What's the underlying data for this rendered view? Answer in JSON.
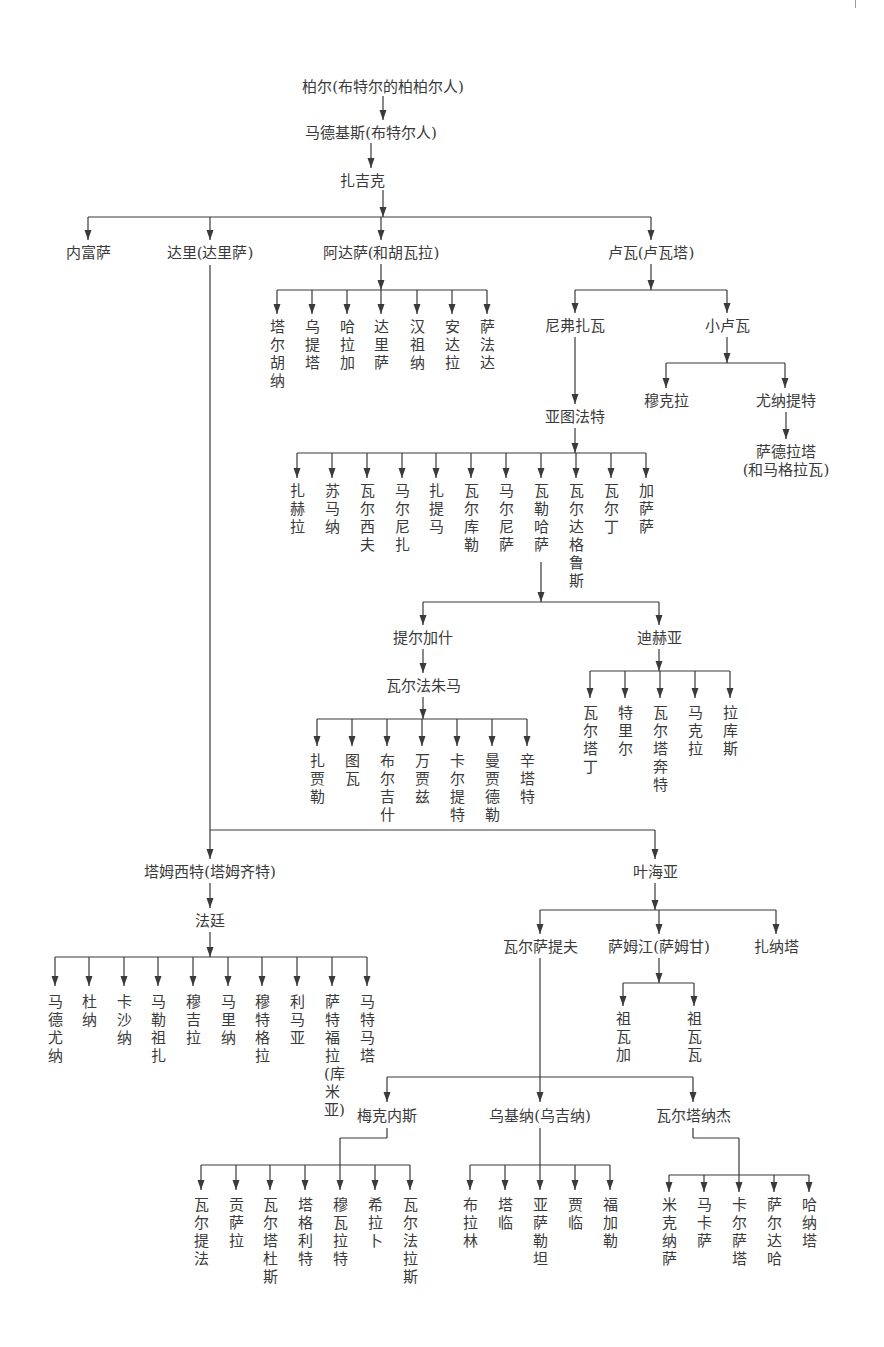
{
  "page": {
    "number_fragment": ""
  },
  "style": {
    "line_color": "#3a3a3a",
    "text_color": "#3a3a3a"
  },
  "nodes": {
    "bol": {
      "label": "柏尔(布特尔的柏柏尔人)",
      "x": 383,
      "y": 78
    },
    "madghis": {
      "label": "马德基斯(布特尔人)",
      "x": 371,
      "y": 124
    },
    "zajik": {
      "label": "扎吉克",
      "x": 362,
      "y": 172
    },
    "nefusa": {
      "label": "内富萨",
      "x": 88,
      "y": 244
    },
    "dari": {
      "label": "达里(达里萨)",
      "x": 210,
      "y": 244
    },
    "adasa": {
      "label": "阿达萨(和胡瓦拉)",
      "x": 381,
      "y": 244
    },
    "luwa": {
      "label": "卢瓦(卢瓦塔)",
      "x": 651,
      "y": 244
    },
    "nifzawa": {
      "label": "尼弗扎瓦",
      "x": 575,
      "y": 317
    },
    "little_luwa": {
      "label": "小卢瓦",
      "x": 727,
      "y": 317
    },
    "mukla": {
      "label": "穆克拉",
      "x": 666,
      "y": 392
    },
    "yunatit": {
      "label": "尤纳提特",
      "x": 786,
      "y": 392
    },
    "sadrata_1": {
      "label": "萨德拉塔",
      "x": 786,
      "y": 443
    },
    "sadrata_2": {
      "label": "(和马格拉瓦)",
      "x": 786,
      "y": 461
    },
    "yatufat": {
      "label": "亚图法特",
      "x": 575,
      "y": 408
    },
    "tirgash": {
      "label": "提尔加什",
      "x": 423,
      "y": 629
    },
    "dihya": {
      "label": "迪赫亚",
      "x": 659,
      "y": 629
    },
    "warfajuma": {
      "label": "瓦尔法朱马",
      "x": 423,
      "y": 677
    },
    "tamsit": {
      "label": "塔姆西特(塔姆齐特)",
      "x": 210,
      "y": 863
    },
    "yahya": {
      "label": "叶海亚",
      "x": 655,
      "y": 863
    },
    "fatin": {
      "label": "法廷",
      "x": 210,
      "y": 912
    },
    "warsatif": {
      "label": "瓦尔萨提夫",
      "x": 540,
      "y": 938
    },
    "samjan": {
      "label": "萨姆江(萨姆甘)",
      "x": 659,
      "y": 938
    },
    "zanata": {
      "label": "扎纳塔",
      "x": 776,
      "y": 938
    },
    "meknes": {
      "label": "梅克内斯",
      "x": 387,
      "y": 1107
    },
    "ukina": {
      "label": "乌基纳(乌吉纳)",
      "x": 540,
      "y": 1107
    },
    "wartanaj": {
      "label": "瓦尔塔纳杰",
      "x": 693,
      "y": 1107
    }
  },
  "vertical_groups": {
    "adasa_children": {
      "y": 318,
      "items": [
        {
          "label": "塔尔胡纳",
          "x": 277
        },
        {
          "label": "乌提塔",
          "x": 312
        },
        {
          "label": "哈拉加",
          "x": 347
        },
        {
          "label": "达里萨",
          "x": 381
        },
        {
          "label": "汉祖纳",
          "x": 417
        },
        {
          "label": "安达拉",
          "x": 452
        },
        {
          "label": "萨法达",
          "x": 487
        }
      ]
    },
    "yatufat_children": {
      "y": 482,
      "items": [
        {
          "label": "扎赫拉",
          "x": 297
        },
        {
          "label": "苏马纳",
          "x": 332
        },
        {
          "label": "瓦尔西夫",
          "x": 367
        },
        {
          "label": "马尔尼扎",
          "x": 402
        },
        {
          "label": "扎提马",
          "x": 436
        },
        {
          "label": "瓦尔库勒",
          "x": 471
        },
        {
          "label": "马尔尼萨",
          "x": 506
        },
        {
          "label": "瓦勒哈萨",
          "x": 541
        },
        {
          "label": "瓦尔达格鲁斯",
          "x": 576
        },
        {
          "label": "瓦尔丁",
          "x": 611
        },
        {
          "label": "加萨萨",
          "x": 646
        }
      ]
    },
    "warfajuma_children": {
      "y": 752,
      "items": [
        {
          "label": "扎贾勒",
          "x": 317
        },
        {
          "label": "图瓦",
          "x": 352
        },
        {
          "label": "布尔吉什",
          "x": 387
        },
        {
          "label": "万贾兹",
          "x": 422
        },
        {
          "label": "卡尔提特",
          "x": 457
        },
        {
          "label": "曼贾德勒",
          "x": 492
        },
        {
          "label": "辛塔特",
          "x": 527
        }
      ]
    },
    "dihya_children": {
      "y": 704,
      "items": [
        {
          "label": "瓦尔塔丁",
          "x": 590
        },
        {
          "label": "特里尔",
          "x": 625
        },
        {
          "label": "瓦尔塔奔特",
          "x": 660
        },
        {
          "label": "马克拉",
          "x": 695
        },
        {
          "label": "拉库斯",
          "x": 730
        }
      ]
    },
    "fatin_children": {
      "y": 993,
      "items": [
        {
          "label": "马德尤纳",
          "x": 55
        },
        {
          "label": "杜纳",
          "x": 89
        },
        {
          "label": "卡沙纳",
          "x": 124
        },
        {
          "label": "马勒祖扎",
          "x": 158
        },
        {
          "label": "穆吉拉",
          "x": 193
        },
        {
          "label": "马里纳",
          "x": 228
        },
        {
          "label": "穆特格拉",
          "x": 262
        },
        {
          "label": "利马亚",
          "x": 297
        },
        {
          "label": "萨特福拉(库米亚)",
          "x": 332
        },
        {
          "label": "马特马塔",
          "x": 367
        }
      ]
    },
    "samjan_children": {
      "y": 1010,
      "items": [
        {
          "label": "祖瓦加",
          "x": 623
        },
        {
          "label": "祖瓦瓦",
          "x": 694
        }
      ]
    },
    "meknes_children": {
      "y": 1196,
      "items": [
        {
          "label": "瓦尔提法",
          "x": 201
        },
        {
          "label": "贡萨拉",
          "x": 236
        },
        {
          "label": "瓦尔塔杜斯",
          "x": 270
        },
        {
          "label": "塔格利特",
          "x": 305
        },
        {
          "label": "穆瓦拉特",
          "x": 340
        },
        {
          "label": "希拉卜",
          "x": 375
        },
        {
          "label": "瓦尔法拉斯",
          "x": 410
        }
      ]
    },
    "ukina_children": {
      "y": 1196,
      "items": [
        {
          "label": "布拉林",
          "x": 470
        },
        {
          "label": "塔临",
          "x": 505
        },
        {
          "label": "亚萨勒坦",
          "x": 540
        },
        {
          "label": "贾临",
          "x": 575
        },
        {
          "label": "福加勒",
          "x": 610
        }
      ]
    },
    "wartanaj_children": {
      "y": 1196,
      "items": [
        {
          "label": "米克纳萨",
          "x": 669
        },
        {
          "label": "马卡萨",
          "x": 704
        },
        {
          "label": "卡尔萨塔",
          "x": 739
        },
        {
          "label": "萨尔达哈",
          "x": 774
        },
        {
          "label": "哈纳塔",
          "x": 809
        }
      ]
    }
  },
  "edges": [
    {
      "type": "v",
      "x": 383,
      "y1": 96,
      "y2": 120
    },
    {
      "type": "v",
      "x": 371,
      "y1": 143,
      "y2": 168
    },
    {
      "type": "bar",
      "y": 217,
      "x1": 88,
      "x2": 651,
      "stem_x": 383,
      "stem_y": 190,
      "kids": [
        88,
        210,
        381,
        651
      ],
      "arrow_y": 240
    },
    {
      "type": "bar",
      "y": 290,
      "x1": 277,
      "x2": 487,
      "stem_x": 381,
      "stem_y": 264,
      "kids": [
        277,
        312,
        347,
        381,
        417,
        452,
        487
      ],
      "arrow_y": 314
    },
    {
      "type": "bar",
      "y": 290,
      "x1": 575,
      "x2": 727,
      "stem_x": 651,
      "stem_y": 264,
      "kids": [
        575,
        727
      ],
      "arrow_y": 313
    },
    {
      "type": "v",
      "x": 575,
      "y1": 337,
      "y2": 404
    },
    {
      "type": "bar",
      "y": 363,
      "x1": 666,
      "x2": 785,
      "stem_x": 727,
      "stem_y": 337,
      "kids": [
        666,
        785
      ],
      "arrow_y": 388
    },
    {
      "type": "v",
      "x": 786,
      "y1": 412,
      "y2": 439
    },
    {
      "type": "bar",
      "y": 453,
      "x1": 297,
      "x2": 646,
      "stem_x": 575,
      "stem_y": 428,
      "kids": [
        297,
        332,
        367,
        402,
        436,
        471,
        506,
        541,
        576,
        611,
        646
      ],
      "arrow_y": 478
    },
    {
      "type": "v",
      "x": 541,
      "y1": 562,
      "y2": 602
    },
    {
      "type": "bar",
      "y": 602,
      "x1": 423,
      "x2": 659,
      "stem_x": 541,
      "stem_y": 602,
      "kids": [
        423,
        659
      ],
      "arrow_y": 625
    },
    {
      "type": "v",
      "x": 423,
      "y1": 649,
      "y2": 673
    },
    {
      "type": "bar",
      "y": 719,
      "x1": 317,
      "x2": 527,
      "stem_x": 423,
      "stem_y": 697,
      "kids": [
        317,
        352,
        387,
        422,
        457,
        492,
        527
      ],
      "arrow_y": 746
    },
    {
      "type": "bar",
      "y": 671,
      "x1": 590,
      "x2": 730,
      "stem_x": 659,
      "stem_y": 649,
      "kids": [
        590,
        625,
        660,
        695,
        730
      ],
      "arrow_y": 698
    },
    {
      "type": "vline",
      "x": 210,
      "y1": 265,
      "y2": 830
    },
    {
      "type": "bar",
      "y": 830,
      "x1": 210,
      "x2": 655,
      "stem_x": 210,
      "stem_y": 830,
      "kids": [
        210,
        655
      ],
      "arrow_y": 859
    },
    {
      "type": "v",
      "x": 210,
      "y1": 883,
      "y2": 908
    },
    {
      "type": "bar",
      "y": 957,
      "x1": 55,
      "x2": 367,
      "stem_x": 210,
      "stem_y": 932,
      "kids": [
        55,
        89,
        124,
        158,
        193,
        228,
        262,
        297,
        332,
        367
      ],
      "arrow_y": 986
    },
    {
      "type": "bar",
      "y": 910,
      "x1": 540,
      "x2": 776,
      "stem_x": 655,
      "stem_y": 883,
      "kids": [
        540,
        659,
        776
      ],
      "arrow_y": 934
    },
    {
      "type": "bar",
      "y": 983,
      "x1": 623,
      "x2": 694,
      "stem_x": 659,
      "stem_y": 958,
      "kids": [
        623,
        694
      ],
      "arrow_y": 1006
    },
    {
      "type": "vline",
      "x": 540,
      "y1": 958,
      "y2": 1077
    },
    {
      "type": "bar",
      "y": 1077,
      "x1": 387,
      "x2": 693,
      "stem_x": 540,
      "stem_y": 1077,
      "kids": [
        387,
        540,
        693
      ],
      "arrow_y": 1102
    },
    {
      "type": "elbow",
      "points": [
        [
          387,
          1128
        ],
        [
          387,
          1138
        ],
        [
          340,
          1138
        ],
        [
          340,
          1165
        ]
      ]
    },
    {
      "type": "bar",
      "y": 1165,
      "x1": 201,
      "x2": 410,
      "stem_x": 340,
      "stem_y": 1165,
      "kids": [
        201,
        236,
        270,
        305,
        340,
        375,
        410
      ],
      "arrow_y": 1190
    },
    {
      "type": "vline",
      "x": 540,
      "y1": 1128,
      "y2": 1165
    },
    {
      "type": "bar",
      "y": 1165,
      "x1": 470,
      "x2": 610,
      "stem_x": 540,
      "stem_y": 1165,
      "kids": [
        470,
        505,
        540,
        575,
        610
      ],
      "arrow_y": 1190
    },
    {
      "type": "elbow",
      "points": [
        [
          693,
          1128
        ],
        [
          693,
          1138
        ],
        [
          739,
          1138
        ],
        [
          739,
          1175
        ]
      ]
    },
    {
      "type": "bar",
      "y": 1175,
      "x1": 669,
      "x2": 809,
      "stem_x": 739,
      "stem_y": 1175,
      "kids": [
        669,
        704,
        739,
        774,
        809
      ],
      "arrow_y": 1192
    }
  ]
}
